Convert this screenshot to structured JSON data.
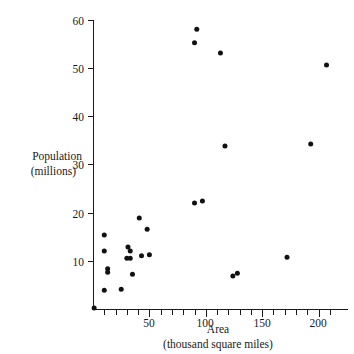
{
  "chart_data": {
    "type": "scatter",
    "title": "",
    "xlabel": "Area",
    "xlabel_sub": "(thousand square miles)",
    "ylabel": "Population",
    "ylabel_sub": "(millions)",
    "xlim": [
      0,
      220
    ],
    "ylim": [
      0,
      62
    ],
    "grid": false,
    "legend": null,
    "x_major_ticks": [
      50,
      100,
      150,
      200
    ],
    "x_major_tick_labels": [
      "50",
      "100",
      "150",
      "200"
    ],
    "x_minor_tick_step": 10,
    "y_major_ticks": [
      10,
      20,
      30,
      40,
      50,
      60
    ],
    "y_major_tick_labels": [
      "10",
      "20",
      "30",
      "40",
      "50",
      "60"
    ],
    "marker": "filled-circle",
    "marker_color": "#111111",
    "points": [
      {
        "x": 1,
        "y": 0.4
      },
      {
        "x": 10,
        "y": 15.5
      },
      {
        "x": 10,
        "y": 12.2
      },
      {
        "x": 10,
        "y": 4.1
      },
      {
        "x": 13,
        "y": 8.5
      },
      {
        "x": 13,
        "y": 7.8
      },
      {
        "x": 25,
        "y": 4.3
      },
      {
        "x": 31,
        "y": 13.0
      },
      {
        "x": 33,
        "y": 12.2
      },
      {
        "x": 33,
        "y": 10.7
      },
      {
        "x": 30,
        "y": 10.7
      },
      {
        "x": 35,
        "y": 7.4
      },
      {
        "x": 41,
        "y": 19.0
      },
      {
        "x": 43,
        "y": 11.2
      },
      {
        "x": 48,
        "y": 16.7
      },
      {
        "x": 50,
        "y": 11.4
      },
      {
        "x": 90,
        "y": 22.1
      },
      {
        "x": 97,
        "y": 22.5
      },
      {
        "x": 92,
        "y": 58.0
      },
      {
        "x": 90,
        "y": 55.2
      },
      {
        "x": 113,
        "y": 53.1
      },
      {
        "x": 117,
        "y": 33.9
      },
      {
        "x": 124,
        "y": 7.0
      },
      {
        "x": 128,
        "y": 7.6
      },
      {
        "x": 172,
        "y": 10.9
      },
      {
        "x": 193,
        "y": 34.3
      },
      {
        "x": 207,
        "y": 50.6
      }
    ]
  }
}
